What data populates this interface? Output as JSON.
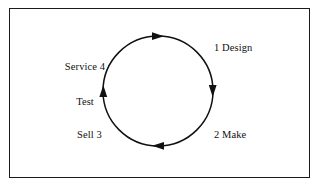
{
  "figure": {
    "frame": {
      "border_color": "#1b1b1b",
      "background_color": "#ffffff"
    },
    "cycle": {
      "direction": "clockwise",
      "stroke_color": "#111111",
      "center_x": 158,
      "center_y": 91,
      "radius": 55,
      "arrow_positions": [
        "top",
        "right",
        "bottom",
        "left"
      ]
    },
    "labels": {
      "design": "1 Design",
      "make": "2 Make",
      "sell": "Sell 3",
      "service_line_1": "Service 4",
      "service_line_2": "Test"
    }
  }
}
